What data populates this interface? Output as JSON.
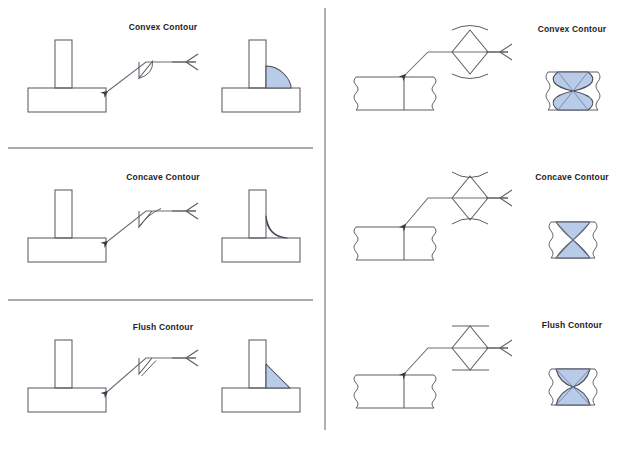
{
  "figure": {
    "title_row_labels": [
      "Convex Contour",
      "Concave Contour",
      "Flush Contour"
    ],
    "line_color": "#5c5c66",
    "weld_fill_color": "#b8cbe8",
    "weld_edge_color": "#4a4a56",
    "background": "#ffffff",
    "divider_color": "#8d8d97",
    "caption": ""
  },
  "panels": [
    {
      "id": "fillet",
      "name": "fillet-weld-panel",
      "joint_type": "T-joint fillet weld",
      "rows": [
        {
          "contour": "Convex Contour",
          "label_x": 163,
          "label_y": 22,
          "symbol": "fillet-convex-contour-symbol",
          "section": "fillet-convex-weld-section"
        },
        {
          "contour": "Concave Contour",
          "label_x": 163,
          "label_y": 172,
          "symbol": "fillet-concave-contour-symbol",
          "section": "fillet-concave-weld-section"
        },
        {
          "contour": "Flush Contour",
          "label_x": 163,
          "label_y": 322,
          "symbol": "fillet-flush-contour-symbol",
          "section": "fillet-flush-weld-section"
        }
      ]
    },
    {
      "id": "groove",
      "name": "groove-weld-panel",
      "joint_type": "Butt joint double-V groove weld",
      "rows": [
        {
          "contour": "Convex Contour",
          "label_x": 572,
          "label_y": 24,
          "symbol": "groove-convex-contour-symbol",
          "section": "groove-convex-weld-section"
        },
        {
          "contour": "Concave Contour",
          "label_x": 572,
          "label_y": 172,
          "symbol": "groove-concave-contour-symbol",
          "section": "groove-concave-weld-section"
        },
        {
          "contour": "Flush Contour",
          "label_x": 572,
          "label_y": 320,
          "symbol": "groove-flush-contour-symbol",
          "section": "groove-flush-weld-section"
        }
      ]
    }
  ]
}
